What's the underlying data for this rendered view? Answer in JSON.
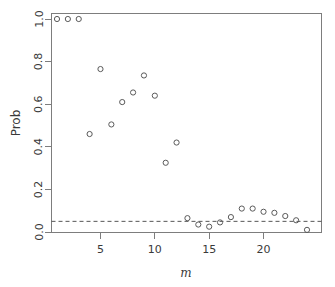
{
  "chart_data": {
    "type": "scatter",
    "title": "",
    "xlabel": "m",
    "ylabel": "Prob",
    "xlim": [
      0.5,
      24.5
    ],
    "ylim": [
      0.0,
      1.0
    ],
    "xticks": [
      5,
      10,
      15,
      20
    ],
    "yticks": [
      "0.0",
      "0.2",
      "0.4",
      "0.6",
      "0.8",
      "1.0"
    ],
    "ytick_values": [
      0.0,
      0.2,
      0.4,
      0.6,
      0.8,
      1.0
    ],
    "grid": false,
    "legend": "none",
    "point_marker": "open-circle",
    "point_color": "#5a5a5a",
    "frame_color": "#7d7d7d",
    "x": [
      1,
      2,
      3,
      4,
      5,
      6,
      7,
      8,
      9,
      10,
      11,
      12,
      13,
      14,
      15,
      16,
      17,
      18,
      19,
      20,
      21,
      22,
      23,
      24
    ],
    "y": [
      1.0,
      1.0,
      1.0,
      0.46,
      0.765,
      0.505,
      0.61,
      0.655,
      0.735,
      0.64,
      0.325,
      0.42,
      0.065,
      0.035,
      0.025,
      0.045,
      0.07,
      0.11,
      0.11,
      0.095,
      0.09,
      0.075,
      0.055,
      0.01
    ],
    "annotations": [
      {
        "name": "significance-threshold",
        "type": "horizontal-dashed-line",
        "value": 0.05,
        "style": "dashed"
      }
    ]
  },
  "labels": {
    "ylabel": "Prob",
    "xlabel": "m"
  }
}
